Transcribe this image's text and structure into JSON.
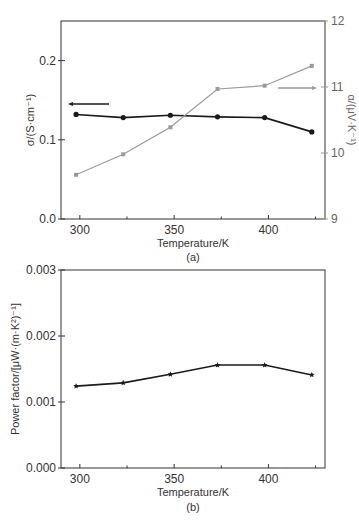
{
  "chart_data": [
    {
      "type": "line",
      "panel_label": "(a)",
      "xlabel": "Temperature/K",
      "ylabel": "σ/(S·cm⁻¹)",
      "ylabel_right": "α/(μV·K⁻¹)",
      "x_ticks": [
        "300",
        "350",
        "400"
      ],
      "y_ticks": [
        "0.0",
        "0.1",
        "0.2"
      ],
      "y_right_ticks": [
        "9",
        "10",
        "11",
        "12"
      ],
      "xlim": [
        290,
        430
      ],
      "ylim": [
        0.0,
        0.25
      ],
      "ylim_right": [
        9,
        12
      ],
      "grid": false,
      "x": [
        298,
        323,
        348,
        373,
        398,
        423
      ],
      "series": [
        {
          "name": "σ",
          "axis": "left",
          "color": "#1a1a1a",
          "marker": "circle",
          "values": [
            0.132,
            0.128,
            0.131,
            0.129,
            0.128,
            0.11
          ]
        },
        {
          "name": "α",
          "axis": "right",
          "color": "#9a9a9a",
          "marker": "square",
          "values": [
            9.67,
            9.98,
            10.39,
            10.97,
            11.02,
            11.32
          ]
        }
      ],
      "annotations": [
        {
          "type": "arrow",
          "direction": "left",
          "points_to": "left axis (σ)",
          "color": "#1a1a1a"
        },
        {
          "type": "arrow",
          "direction": "right",
          "points_to": "right axis (α)",
          "color": "#9a9a9a"
        }
      ]
    },
    {
      "type": "line",
      "panel_label": "(b)",
      "xlabel": "Temperature/K",
      "ylabel": "Power factor/[μW·(m·K²)⁻¹]",
      "x_ticks": [
        "300",
        "350",
        "400"
      ],
      "y_ticks": [
        "0.000",
        "0.001",
        "0.002",
        "0.003"
      ],
      "xlim": [
        290,
        430
      ],
      "ylim": [
        0.0,
        0.003
      ],
      "grid": false,
      "x": [
        298,
        323,
        348,
        373,
        398,
        423
      ],
      "series": [
        {
          "name": "Power factor",
          "color": "#1a1a1a",
          "marker": "star",
          "values": [
            0.00124,
            0.00129,
            0.00142,
            0.00156,
            0.00156,
            0.00141
          ]
        }
      ]
    }
  ]
}
